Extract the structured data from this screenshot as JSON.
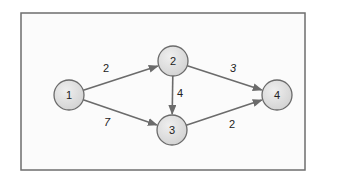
{
  "diagram": {
    "type": "directed-weighted-graph",
    "frame": {
      "x": 21,
      "y": 13,
      "width": 284,
      "height": 157,
      "fill": "#fbfbfb",
      "stroke": "#6e6e6e"
    },
    "colors": {
      "node_fill": "#dedede",
      "node_fill_highlight": "#eeeeee",
      "node_stroke": "#6a6a6a",
      "edge": "#6b6b6b",
      "label": "#222222"
    },
    "nodes": [
      {
        "id": "1",
        "label": "1",
        "cx": 69,
        "cy": 95,
        "r": 15
      },
      {
        "id": "2",
        "label": "2",
        "cx": 173,
        "cy": 61,
        "r": 15
      },
      {
        "id": "3",
        "label": "3",
        "cx": 172,
        "cy": 130,
        "r": 15
      },
      {
        "id": "4",
        "label": "4",
        "cx": 277,
        "cy": 95,
        "r": 15
      }
    ],
    "edges": [
      {
        "from": "1",
        "to": "2",
        "weight": "2",
        "label_x": 106,
        "label_y": 72,
        "italic": false
      },
      {
        "from": "1",
        "to": "3",
        "weight": "7",
        "label_x": 107,
        "label_y": 126,
        "italic": true
      },
      {
        "from": "2",
        "to": "3",
        "weight": "4",
        "label_x": 180,
        "label_y": 97,
        "italic": false
      },
      {
        "from": "2",
        "to": "4",
        "weight": "3",
        "label_x": 233,
        "label_y": 72,
        "italic": true
      },
      {
        "from": "3",
        "to": "4",
        "weight": "2",
        "label_x": 232,
        "label_y": 128,
        "italic": false
      }
    ]
  }
}
